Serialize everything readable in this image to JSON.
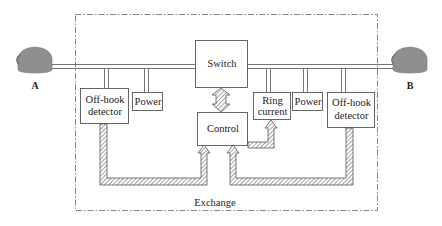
{
  "diagram": {
    "container_label": "Exchange",
    "endpoints": {
      "left": {
        "label": "A",
        "icon": "telephone-icon"
      },
      "right": {
        "label": "B",
        "icon": "telephone-icon"
      }
    },
    "blocks": {
      "switch": "Switch",
      "control": "Control",
      "offhook_left_1": "Off-hook",
      "offhook_left_2": "detector",
      "power_left": "Power",
      "ring_1": "Ring",
      "ring_2": "current",
      "power_right": "Power",
      "offhook_right_1": "Off-hook",
      "offhook_right_2": "detector"
    },
    "connections": [
      {
        "from": "A",
        "to": "B",
        "type": "line",
        "via": "Switch"
      },
      {
        "from": "Switch",
        "to": "Control",
        "type": "bidirectional-hatched-arrow"
      },
      {
        "from": "Off-hook detector (A)",
        "to": "Control",
        "type": "hatched-arrow"
      },
      {
        "from": "Off-hook detector (B)",
        "to": "Control",
        "type": "hatched-arrow"
      },
      {
        "from": "Control",
        "to": "Ring current",
        "type": "hatched-arrow"
      }
    ],
    "colors": {
      "line": "#555555",
      "phone": "#8c8c8c",
      "hatch": "#777777"
    }
  }
}
